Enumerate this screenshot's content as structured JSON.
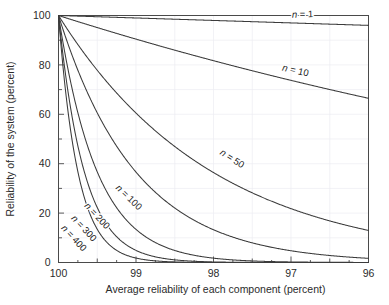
{
  "chart_data": {
    "type": "line",
    "title": "",
    "xlabel": "Average reliability of each component (percent)",
    "ylabel": "Reliability of the system (percent)",
    "xlim": [
      100,
      96
    ],
    "ylim": [
      0,
      100
    ],
    "x_ticks": [
      100,
      99,
      98,
      97,
      96
    ],
    "x_tick_labels": [
      "100",
      "99",
      "98",
      "97",
      "96"
    ],
    "x_minor_step": 0.25,
    "y_ticks": [
      0,
      20,
      40,
      60,
      80,
      100
    ],
    "y_tick_labels": [
      "0",
      "20",
      "40",
      "60",
      "80",
      "100"
    ],
    "y_minor_step": 10,
    "grid": true,
    "grid_color": "#ededf2",
    "axis_reversed_x": true,
    "legend_position": "inline-curve-labels",
    "curve_color": "#3b3b3b",
    "relation": "R_system = p^n",
    "series": [
      {
        "name": "n = 1",
        "n": 1,
        "label": "n = 1",
        "label_prefix": "n",
        "label_suffix": " = 1",
        "label_x": 96.85,
        "label_y": 99.2,
        "label_rotation": -1.5,
        "x": [
          100,
          99.5,
          99,
          98.5,
          98,
          97.5,
          97,
          96.5,
          96
        ],
        "y": [
          100,
          99.5,
          99,
          98.5,
          98,
          97.5,
          97,
          96.5,
          96
        ]
      },
      {
        "name": "n = 10",
        "n": 10,
        "label": "n = 10",
        "label_prefix": "n",
        "label_suffix": " = 10",
        "label_x": 96.95,
        "label_y": 76.5,
        "label_rotation": 13,
        "x": [
          100,
          99.5,
          99,
          98.5,
          98,
          97.5,
          97,
          96.5,
          96
        ],
        "y": [
          100,
          95.1,
          90.4,
          85.9,
          81.7,
          77.6,
          73.7,
          70.0,
          66.5
        ]
      },
      {
        "name": "n = 50",
        "n": 50,
        "label": "n = 50",
        "label_prefix": "n",
        "label_suffix": " = 50",
        "label_x": 97.78,
        "label_y": 41.0,
        "label_rotation": 33,
        "x": [
          100,
          99.75,
          99.5,
          99.25,
          99,
          98.75,
          98.5,
          98.25,
          98,
          97.75,
          97.5,
          97.25,
          97,
          96.75,
          96.5,
          96.25,
          96
        ],
        "y": [
          100,
          88.2,
          77.8,
          68.5,
          60.5,
          53.3,
          47.0,
          41.4,
          36.4,
          32.1,
          28.2,
          24.8,
          21.8,
          19.1,
          16.8,
          14.7,
          13.0
        ]
      },
      {
        "name": "n = 100",
        "n": 100,
        "label": "n = 100",
        "label_prefix": "n",
        "label_suffix": " = 100",
        "label_x": 99.12,
        "label_y": 25.5,
        "label_rotation": 44,
        "x": [
          100,
          99.75,
          99.5,
          99.25,
          99,
          98.75,
          98.5,
          98.25,
          98,
          97.75,
          97.5,
          97.25,
          97,
          96.5,
          96
        ],
        "y": [
          100,
          77.9,
          60.6,
          47.0,
          36.6,
          28.4,
          22.1,
          17.1,
          13.3,
          10.3,
          8.0,
          6.2,
          4.8,
          2.9,
          1.7
        ]
      },
      {
        "name": "n = 200",
        "n": 200,
        "label": "n = 200",
        "label_prefix": "n",
        "label_suffix": " = 200",
        "label_x": 99.53,
        "label_y": 18.0,
        "label_rotation": 47,
        "x": [
          100,
          99.8,
          99.6,
          99.4,
          99.2,
          99,
          98.8,
          98.6,
          98.4,
          98.2,
          98,
          97.5,
          97,
          96.5,
          96
        ],
        "y": [
          100,
          67.0,
          44.8,
          29.9,
          19.9,
          13.3,
          8.9,
          5.9,
          3.9,
          2.6,
          1.8,
          0.6,
          0.2,
          0.1,
          0.03
        ]
      },
      {
        "name": "n = 300",
        "n": 300,
        "label": "n = 300",
        "label_prefix": "n",
        "label_suffix": " = 300",
        "label_x": 99.7,
        "label_y": 13.0,
        "label_rotation": 47,
        "x": [
          100,
          99.85,
          99.7,
          99.55,
          99.4,
          99.25,
          99.1,
          98.95,
          98.8,
          98.6,
          98.4,
          98.2,
          98,
          97.5,
          97,
          96.5,
          96
        ],
        "y": [
          100,
          63.8,
          40.6,
          25.9,
          16.5,
          10.5,
          6.7,
          4.3,
          2.7,
          1.6,
          0.9,
          0.5,
          0.3,
          0.05,
          0.01,
          0.0,
          0.0
        ]
      },
      {
        "name": "n = 400",
        "n": 400,
        "label": "n = 400",
        "label_prefix": "n",
        "label_suffix": " = 400",
        "label_x": 99.83,
        "label_y": 9.0,
        "label_rotation": 47,
        "x": [
          100,
          99.9,
          99.8,
          99.7,
          99.6,
          99.5,
          99.4,
          99.3,
          99.2,
          99.05,
          98.9,
          98.7,
          98.5,
          98.2,
          98,
          97.5,
          97,
          96.5,
          96
        ],
        "y": [
          100,
          67.0,
          44.8,
          29.9,
          20.0,
          13.4,
          8.9,
          5.9,
          3.9,
          2.1,
          1.2,
          0.5,
          0.2,
          0.05,
          0.02,
          0.0,
          0.0,
          0.0,
          0.0
        ]
      }
    ]
  }
}
